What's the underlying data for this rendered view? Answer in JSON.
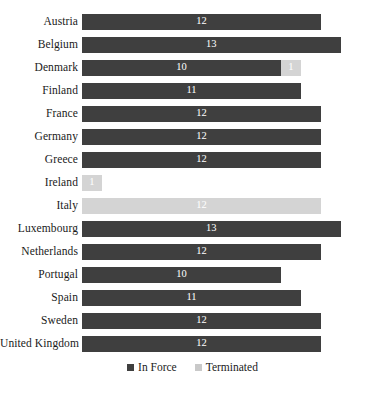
{
  "chart_data": {
    "type": "bar",
    "orientation": "horizontal",
    "stacked": true,
    "title": "",
    "subtitle": "",
    "xlabel": "",
    "ylabel": "",
    "grid": false,
    "xlim": [
      0,
      15
    ],
    "legend_position": "bottom",
    "categories": [
      "Austria",
      "Belgium",
      "Denmark",
      "Finland",
      "France",
      "Germany",
      "Greece",
      "Ireland",
      "Italy",
      "Luxembourg",
      "Netherlands",
      "Portugal",
      "Spain",
      "Sweden",
      "United Kingdom"
    ],
    "series": [
      {
        "name": "In Force",
        "color": "#3f3f3f",
        "values": [
          12,
          13,
          10,
          11,
          12,
          12,
          12,
          0,
          0,
          13,
          12,
          10,
          11,
          12,
          12
        ]
      },
      {
        "name": "Terminated",
        "color": "#d4d4d4",
        "values": [
          0,
          0,
          1,
          0,
          0,
          0,
          0,
          1,
          12,
          0,
          0,
          0,
          0,
          0,
          0
        ]
      }
    ],
    "bars": [
      {
        "category": "Austria",
        "segments": [
          {
            "series": "In Force",
            "value": 12,
            "label": "12"
          }
        ]
      },
      {
        "category": "Belgium",
        "segments": [
          {
            "series": "In Force",
            "value": 13,
            "label": "13"
          }
        ]
      },
      {
        "category": "Denmark",
        "segments": [
          {
            "series": "In Force",
            "value": 10,
            "label": "10"
          },
          {
            "series": "Terminated",
            "value": 1,
            "label": "1"
          }
        ]
      },
      {
        "category": "Finland",
        "segments": [
          {
            "series": "In Force",
            "value": 11,
            "label": "11"
          }
        ]
      },
      {
        "category": "France",
        "segments": [
          {
            "series": "In Force",
            "value": 12,
            "label": "12"
          }
        ]
      },
      {
        "category": "Germany",
        "segments": [
          {
            "series": "In Force",
            "value": 12,
            "label": "12"
          }
        ]
      },
      {
        "category": "Greece",
        "segments": [
          {
            "series": "In Force",
            "value": 12,
            "label": "12"
          }
        ]
      },
      {
        "category": "Ireland",
        "segments": [
          {
            "series": "Terminated",
            "value": 1,
            "label": "1"
          }
        ]
      },
      {
        "category": "Italy",
        "segments": [
          {
            "series": "Terminated",
            "value": 12,
            "label": "12"
          }
        ]
      },
      {
        "category": "Luxembourg",
        "segments": [
          {
            "series": "In Force",
            "value": 13,
            "label": "13"
          }
        ]
      },
      {
        "category": "Netherlands",
        "segments": [
          {
            "series": "In Force",
            "value": 12,
            "label": "12"
          }
        ]
      },
      {
        "category": "Portugal",
        "segments": [
          {
            "series": "In Force",
            "value": 10,
            "label": "10"
          }
        ]
      },
      {
        "category": "Spain",
        "segments": [
          {
            "series": "In Force",
            "value": 11,
            "label": "11"
          }
        ]
      },
      {
        "category": "Sweden",
        "segments": [
          {
            "series": "In Force",
            "value": 12,
            "label": "12"
          }
        ]
      },
      {
        "category": "United Kingdom",
        "segments": [
          {
            "series": "In Force",
            "value": 12,
            "label": "12"
          }
        ]
      }
    ]
  },
  "legend": {
    "items": [
      {
        "label": "In Force",
        "color": "#3f3f3f"
      },
      {
        "label": "Terminated",
        "color": "#c9c9c9"
      }
    ]
  },
  "caption": {
    "text": ""
  }
}
